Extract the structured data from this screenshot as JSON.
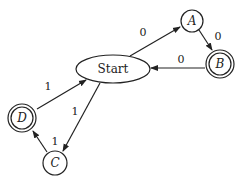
{
  "diagram": {
    "type": "finite-state-machine",
    "nodes": [
      {
        "id": "start",
        "label": "Start",
        "shape": "ellipse",
        "accepting": false
      },
      {
        "id": "A",
        "label": "A",
        "shape": "circle",
        "accepting": false
      },
      {
        "id": "B",
        "label": "B",
        "shape": "double-circle",
        "accepting": true
      },
      {
        "id": "C",
        "label": "C",
        "shape": "circle",
        "accepting": false
      },
      {
        "id": "D",
        "label": "D",
        "shape": "double-circle",
        "accepting": true
      }
    ],
    "edges": [
      {
        "from": "Start",
        "to": "A",
        "label": "0"
      },
      {
        "from": "A",
        "to": "B",
        "label": "0"
      },
      {
        "from": "B",
        "to": "Start",
        "label": "0"
      },
      {
        "from": "Start",
        "to": "C",
        "label": "1"
      },
      {
        "from": "C",
        "to": "D",
        "label": "1"
      },
      {
        "from": "D",
        "to": "Start",
        "label": "1"
      }
    ]
  },
  "colors": {
    "stroke": "#222222",
    "background": "#ffffff"
  }
}
